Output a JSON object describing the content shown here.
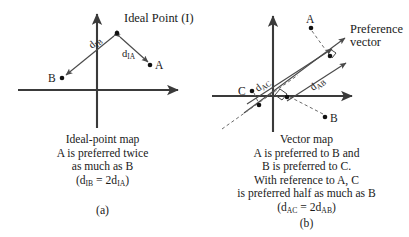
{
  "figure": {
    "background_color": "#ffffff",
    "line_color": "#4a4a4a",
    "axis_color": "#3a3a3a",
    "dot_color": "#111111",
    "text_color": "#1a1a1a"
  },
  "panel_a": {
    "letter": "(a)",
    "ideal_point_label": "Ideal Point (I)",
    "points": [
      {
        "id": "I",
        "label": "",
        "x": 117,
        "y": 33
      },
      {
        "id": "A",
        "label": "A",
        "x": 150,
        "y": 65
      },
      {
        "id": "B",
        "label": "B",
        "x": 62,
        "y": 78
      }
    ],
    "distances": [
      {
        "id": "d_IB",
        "base": "d",
        "sub": "IB",
        "text": "dIB"
      },
      {
        "id": "d_IA",
        "base": "d",
        "sub": "IA",
        "text": "dIA"
      }
    ],
    "caption": [
      "Ideal-point map",
      "A is preferred twice",
      "as much as B"
    ],
    "caption_formula": {
      "prefix": "(d",
      "sub1": "IB",
      "middle": " = 2d",
      "sub2": "IA",
      "suffix": ")"
    }
  },
  "panel_b": {
    "letter": "(b)",
    "preference_vector_label": [
      "Preference",
      "vector"
    ],
    "points": [
      {
        "id": "A",
        "label": "A",
        "x": 311,
        "y": 28
      },
      {
        "id": "B",
        "label": "B",
        "x": 325,
        "y": 117
      },
      {
        "id": "C",
        "label": "C",
        "x": 252,
        "y": 91
      },
      {
        "id": "projA",
        "label": "",
        "x": 327,
        "y": 59
      },
      {
        "id": "projB",
        "label": "",
        "x": 285,
        "y": 97
      },
      {
        "id": "projC",
        "label": "",
        "x": 258,
        "y": 106
      }
    ],
    "distances": [
      {
        "id": "d_AC",
        "base": "d",
        "sub": "AC",
        "text": "dAC"
      },
      {
        "id": "d_AB",
        "base": "d",
        "sub": "AB",
        "text": "dAB"
      }
    ],
    "caption": [
      "Vector map",
      "A is preferred to B and",
      "B is preferred to C.",
      "With reference to A, C",
      "is preferred half as much as B"
    ],
    "caption_formula": {
      "prefix": "(d",
      "sub1": "AC",
      "middle": " = 2d",
      "sub2": "AB",
      "suffix": ")"
    }
  }
}
